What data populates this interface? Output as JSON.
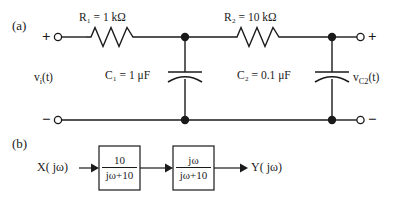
{
  "figure": {
    "panel_a_tag": "(a)",
    "panel_b_tag": "(b)"
  },
  "circuit": {
    "input_terminal_plus": "+",
    "input_terminal_minus": "−",
    "output_terminal_plus": "+",
    "output_terminal_minus": "−",
    "source_label": "v",
    "source_label_sub": "i",
    "source_label_arg": "(t)",
    "output_label": "v",
    "output_label_sub": "C2",
    "output_label_arg": "(t)",
    "components": [
      {
        "id": "R1",
        "symbol": "R",
        "subscript": "1",
        "value_text": "= 1 kΩ",
        "full_text": "R₁ = 1 kΩ",
        "type": "resistor"
      },
      {
        "id": "R2",
        "symbol": "R",
        "subscript": "2",
        "value_text": "= 10 kΩ",
        "full_text": "R₂ = 10 kΩ",
        "type": "resistor"
      },
      {
        "id": "C1",
        "symbol": "C",
        "subscript": "1",
        "value_text": "= 1 μF",
        "full_text": "C₁ = 1 μF",
        "type": "capacitor"
      },
      {
        "id": "C2",
        "symbol": "C",
        "subscript": "2",
        "value_text": "= 0.1 μF",
        "full_text": "C₂ = 0.1 μF",
        "type": "capacitor"
      }
    ]
  },
  "block_diagram": {
    "input_label": "X( jω)",
    "output_label": "Y( jω)",
    "blocks": [
      {
        "numerator": "10",
        "denominator": "jω+10"
      },
      {
        "numerator": "jω",
        "denominator": "jω+10"
      }
    ]
  },
  "style": {
    "line_color": "#1a1a1a",
    "text_color": "#1a1a1a",
    "background": "#ffffff"
  }
}
